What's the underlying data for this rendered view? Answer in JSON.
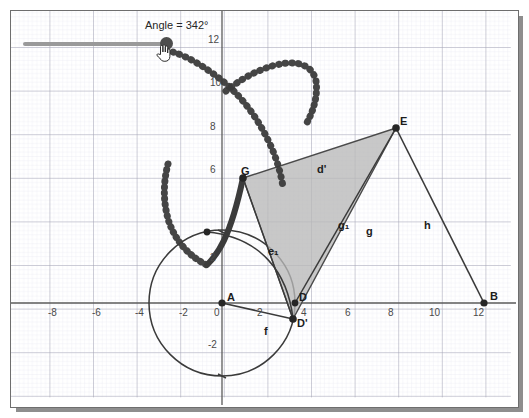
{
  "app": {
    "kind": "dynamic-geometry-worksheet",
    "background": "#ffffff",
    "canvas_bg": "#ffffff"
  },
  "slider": {
    "name": "Angle",
    "label": "Angle = 342°",
    "value": 342,
    "min": 0,
    "max": 360,
    "unit": "°",
    "fill_percent": 95,
    "track_color": "#9a9a9a",
    "handle_color": "#4d4d4d",
    "cursor_icon": "hand-pointer-icon"
  },
  "axes": {
    "x_ticks": [
      "-8",
      "-6",
      "-4",
      "-2",
      "0",
      "2",
      "4",
      "6",
      "8",
      "10",
      "12"
    ],
    "y_ticks": [
      "-2",
      "2",
      "6",
      "8",
      "10",
      "12"
    ],
    "origin_label": "0",
    "grid_major_color": "#9d9dae",
    "grid_minor_color": "#e4e4ee",
    "axis_color": "#5a5a5a"
  },
  "colors": {
    "point": "#262626",
    "segment": "#3a3a3a",
    "polygon_fill": "#b9b9b9",
    "polygon_stroke": "#4a4a4a",
    "trace": "#3b3b3b",
    "circle": "#3a3a3a",
    "arc": "#3a3a3a"
  },
  "points": [
    {
      "name": "A",
      "x": 0,
      "y": 0,
      "label": "A",
      "label_dx": 2,
      "label_dy": -14
    },
    {
      "name": "B",
      "x": 12,
      "y": 0,
      "label": "B",
      "label_dx": 4,
      "label_dy": -15
    },
    {
      "name": "D",
      "x": 3.35,
      "y": 0,
      "label": "D",
      "label_dx": 3,
      "label_dy": -14
    },
    {
      "name": "Dp",
      "x": 3.25,
      "y": -0.75,
      "label": "D'",
      "label_dx": 3,
      "label_dy": -4
    },
    {
      "name": "E",
      "x": 8,
      "y": 8.05,
      "label": "E",
      "label_dx": 3,
      "label_dy": -15
    },
    {
      "name": "G",
      "x": 0.95,
      "y": 5.75,
      "label": "G",
      "label_dx": -1,
      "label_dy": -15
    },
    {
      "name": "T",
      "x": -0.6,
      "y": 3.25,
      "label": "",
      "label_dx": 0,
      "label_dy": 0
    }
  ],
  "segments": [
    {
      "name": "f",
      "label": "f",
      "from": "A",
      "to": "Dp",
      "label_x": 2.0,
      "label_y": -0.95
    },
    {
      "name": "d'",
      "label": "d'",
      "from": "G",
      "to": "E",
      "label_x": 4.4,
      "label_y": 6.55
    },
    {
      "name": "g",
      "label": "g",
      "from": "Dp",
      "to": "E",
      "label_x": 5.25,
      "label_y": 3.85
    },
    {
      "name": "g1",
      "label": "g₁",
      "from": "D",
      "to": "E",
      "label_x": 4.35,
      "label_y": 4.05
    },
    {
      "name": "h",
      "label": "h",
      "from": "E",
      "to": "B",
      "label_x": 9.6,
      "label_y": 3.6
    },
    {
      "name": "GD",
      "label": "",
      "from": "G",
      "to": "Dp",
      "label_x": 0,
      "label_y": 0
    }
  ],
  "arcs": [
    {
      "name": "e1",
      "label": "e₁",
      "label_x": 2.1,
      "label_y": 2.95
    }
  ],
  "circle": {
    "name": "circle-A",
    "center": "A",
    "cx": 0,
    "cy": 0,
    "radius": 3.35
  },
  "polygon": {
    "name": "triangle-G-E-Dprime",
    "vertices": [
      "G",
      "E",
      "Dp"
    ],
    "fill": "#b9b9b9",
    "opacity": 0.75
  },
  "trace": {
    "name": "locus-of-G",
    "style": "thick-dotted",
    "description": "trace of point G"
  }
}
